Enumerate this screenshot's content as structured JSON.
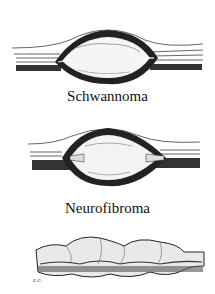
{
  "figure": {
    "panels": [
      {
        "id": "schwannoma",
        "label": "Schwannoma",
        "description": "eccentric encapsulated tumor displacing nerve fascicles"
      },
      {
        "id": "neurofibroma",
        "label": "Neurofibroma",
        "description": "fusiform tumor with fascicles entering and exiting the mass"
      },
      {
        "id": "plexiform",
        "label": "",
        "description": "multinodular plexiform thickening of the nerve"
      }
    ],
    "signature": "E.G."
  },
  "colors": {
    "ink": "#111111",
    "paper": "#ffffff",
    "shade": "#555555"
  }
}
